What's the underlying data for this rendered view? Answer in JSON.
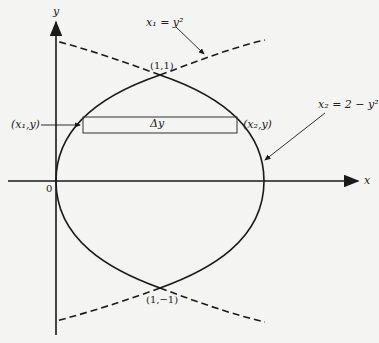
{
  "axes": {
    "x_label": "x",
    "y_label": "y",
    "origin_label": "0"
  },
  "curves": {
    "left": {
      "name": "x1",
      "equation_lhs": "x₁",
      "equation_rhs": "= y²",
      "style": "solid inside region, dashed outside"
    },
    "right": {
      "name": "x2",
      "equation_lhs": "x₂",
      "equation_rhs": "= 2 − y²",
      "style": "solid inside region, dashed outside"
    }
  },
  "points": {
    "top_intersection": "(1,1)",
    "bottom_intersection": "(1,−1)",
    "left_strip_point": "(x₁,y)",
    "right_strip_point": "(x₂,y)"
  },
  "strip": {
    "label": "Δy"
  },
  "colors": {
    "stroke": "#1a1a1a",
    "background": "#f4f4f2"
  }
}
